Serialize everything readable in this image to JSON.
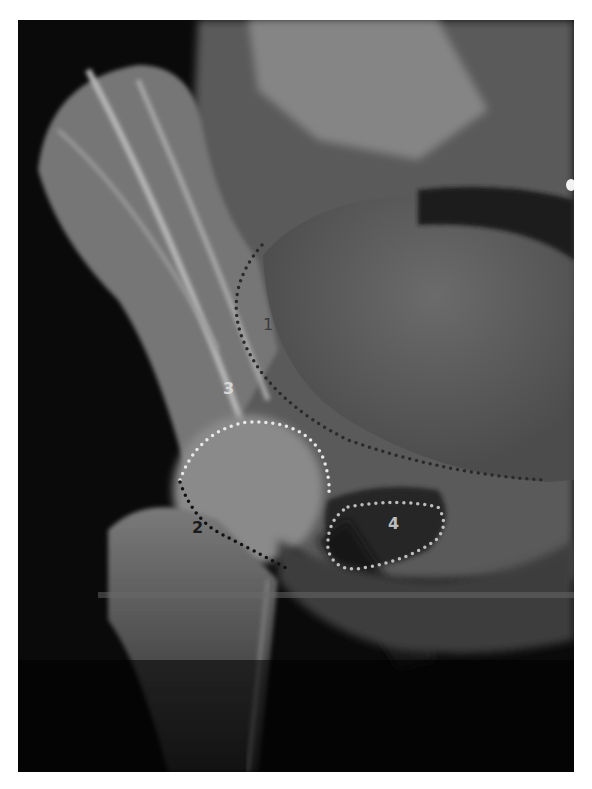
{
  "figure": {
    "type": "pelvis-radiograph",
    "background_color": "#000000",
    "page_background": "#ffffff"
  },
  "annotations": [
    {
      "id": "1",
      "label": "1",
      "dot_color": "#2a2a2a",
      "label_color": "#3a3a3a",
      "style": "black-dotted"
    },
    {
      "id": "2",
      "label": "2",
      "dot_color": "#111111",
      "label_color": "#1a1a1a",
      "style": "black-dotted"
    },
    {
      "id": "3",
      "label": "3",
      "dot_color": "#e8e8e8",
      "label_color": "#d8d8d8",
      "style": "white-dotted"
    },
    {
      "id": "4",
      "label": "4",
      "dot_color": "#bdbdbd",
      "label_color": "#bdbdbd",
      "style": "grey-dotted"
    }
  ]
}
